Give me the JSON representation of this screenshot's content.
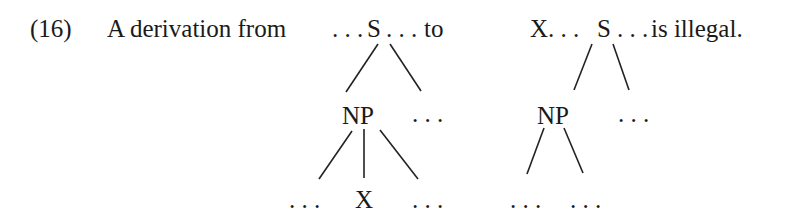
{
  "example": {
    "number": "(16)",
    "intro": "A derivation from",
    "connector": "to",
    "conclusion": "is illegal."
  },
  "tree_left": {
    "root": "… S …",
    "root_line": "…S…",
    "np": "NP",
    "np_sibling": "…",
    "children": [
      "…",
      "X",
      "…"
    ]
  },
  "tree_right": {
    "root_line": "X…S…",
    "np": "NP",
    "np_sibling": "…",
    "children": [
      "…",
      "…"
    ]
  },
  "colors": {
    "text": "#1a1a1a",
    "lines": "#222222",
    "background": "#ffffff"
  }
}
